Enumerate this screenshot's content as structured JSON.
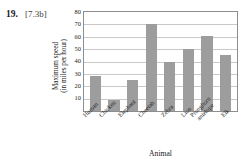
{
  "exercise": {
    "number": "19.",
    "reference": "[7.3b]"
  },
  "chart_data": {
    "type": "bar",
    "title": "",
    "categories": [
      "Human",
      "Chicken",
      "Elephant",
      "Cheetah",
      "Zebra",
      "Lion",
      "Pronghorn antelope",
      "Elk"
    ],
    "values": [
      28,
      9,
      25,
      70,
      40,
      50,
      61,
      45
    ],
    "xlabel": "Animal",
    "ylabel": "Maximum speed (in miles per hour)",
    "ylabel_lines": [
      "Maximum speed",
      "(in miles per hour)"
    ],
    "ylim": [
      0,
      80
    ],
    "yticks": [
      10,
      20,
      30,
      40,
      50,
      60,
      70,
      80
    ],
    "ytick_labels": [
      "10",
      "20",
      "30",
      "40",
      "50",
      "60",
      "70",
      "80"
    ],
    "grid": true,
    "legend": false,
    "bar_color": "#9d9d9d",
    "grid_color": "#c9c9c9",
    "axis_color": "#8e8e8e"
  }
}
